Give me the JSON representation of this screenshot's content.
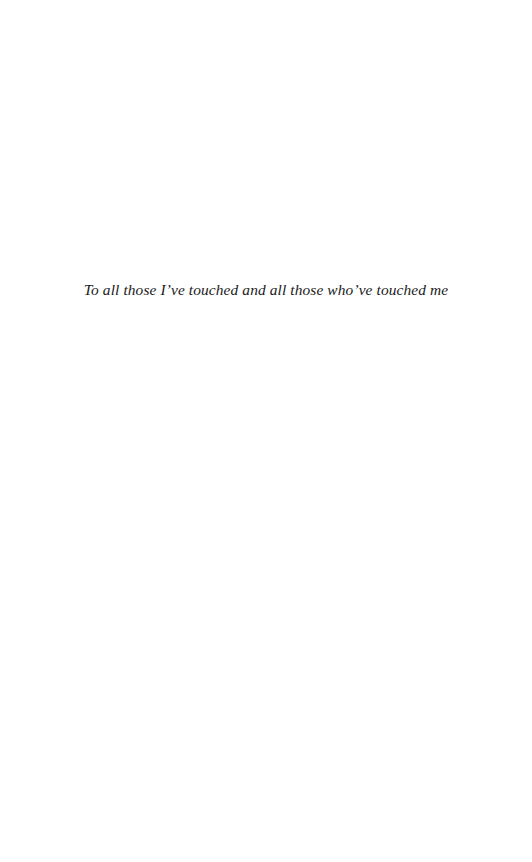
{
  "page": {
    "kind": "book-dedication-page",
    "background_color": "#ffffff",
    "width": 532,
    "height": 862
  },
  "dedication": {
    "text": "To all those I’ve touched and all those who’ve touched me",
    "color": "#1a1a1a",
    "alignment": "center",
    "style": "italic-serif"
  }
}
